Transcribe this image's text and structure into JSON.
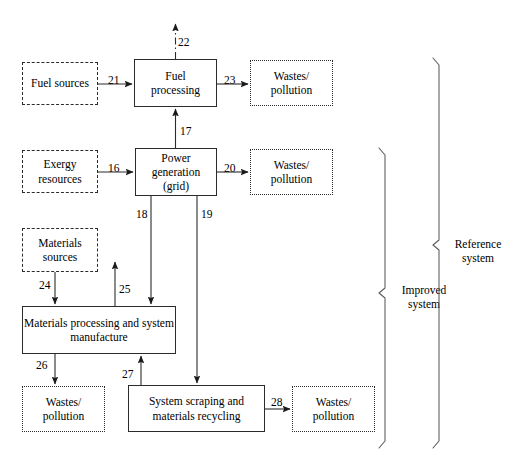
{
  "diagram": {
    "title_present": false,
    "boxes": {
      "fuel_sources": "Fuel sources",
      "fuel_processing": "Fuel\nprocessing",
      "wastes_top": "Wastes/\npollution",
      "exergy_resources": "Exergy\nresources",
      "power_generation": "Power\ngeneration\n(grid)",
      "wastes_mid": "Wastes/\npollution",
      "materials_sources": "Materials\nsources",
      "materials_processing": "Materials processing and system\nmanufacture",
      "wastes_lower_left": "Wastes/\npollution",
      "system_scraping": "System scraping and\nmaterials recycling",
      "wastes_bottom_right": "Wastes/\npollution"
    },
    "flow_numbers": {
      "n16": "16",
      "n17": "17",
      "n18": "18",
      "n19": "19",
      "n20": "20",
      "n21": "21",
      "n22": "22",
      "n23": "23",
      "n24": "24",
      "n25": "25",
      "n26": "26",
      "n27": "27",
      "n28": "28"
    },
    "brackets": {
      "improved": "Improved\nsystem",
      "reference": "Reference\nsystem"
    },
    "colors": {
      "stroke": "#2b2b2b",
      "text": "#000000",
      "background": "#ffffff"
    }
  }
}
